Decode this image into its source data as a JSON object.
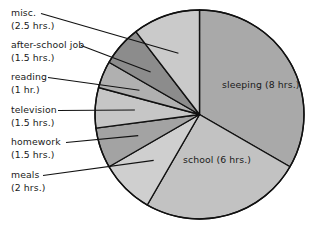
{
  "chart_data": {
    "type": "pie",
    "title": "",
    "subtitle": "",
    "xlabel": "",
    "ylabel": "",
    "total_hours": 24,
    "units": "hrs.",
    "legend_position": "callout-labels-left",
    "grid": false,
    "start_angle_deg": 0,
    "direction": "clockwise",
    "categories": [
      "sleeping",
      "school",
      "meals",
      "homework",
      "television",
      "reading",
      "after-school job",
      "misc."
    ],
    "values": [
      8,
      6,
      2,
      1.5,
      1.5,
      1,
      1.5,
      2.5
    ],
    "slices": [
      {
        "name": "sleeping",
        "label": "sleeping",
        "value_text": "(8 hrs.)",
        "hours": 8,
        "color": "#a9a9a9",
        "start_deg": 0,
        "end_deg": 120,
        "label_placement": "inside"
      },
      {
        "name": "school",
        "label": "school",
        "value_text": "(6 hrs.)",
        "hours": 6,
        "color": "#c2c2c2",
        "start_deg": 120,
        "end_deg": 210,
        "label_placement": "inside"
      },
      {
        "name": "meals",
        "label": "meals",
        "value_text": "(2 hrs.)",
        "hours": 2,
        "color": "#cfcfcf",
        "start_deg": 210,
        "end_deg": 240,
        "label_placement": "callout"
      },
      {
        "name": "homework",
        "label": "homework",
        "value_text": "(1.5 hrs.)",
        "hours": 1.5,
        "color": "#a3a3a3",
        "start_deg": 240,
        "end_deg": 262.5,
        "label_placement": "callout"
      },
      {
        "name": "television",
        "label": "television",
        "value_text": "(1.5 hrs.)",
        "hours": 1.5,
        "color": "#c6c6c6",
        "start_deg": 262.5,
        "end_deg": 285,
        "label_placement": "callout"
      },
      {
        "name": "reading",
        "label": "reading",
        "value_text": "(1 hr.)",
        "hours": 1,
        "color": "#b0b0b0",
        "start_deg": 285,
        "end_deg": 300,
        "label_placement": "callout"
      },
      {
        "name": "after-school-job",
        "label": "after-school job",
        "value_text": "(1.5 hrs.)",
        "hours": 1.5,
        "color": "#8c8c8c",
        "start_deg": 300,
        "end_deg": 322.5,
        "label_placement": "callout"
      },
      {
        "name": "misc",
        "label": "misc.",
        "value_text": "(2.5 hrs.)",
        "hours": 2.5,
        "color": "#cacaca",
        "start_deg": 322.5,
        "end_deg": 360,
        "label_placement": "callout"
      }
    ],
    "geometry": {
      "center_x": 199.5,
      "center_y": 114.5,
      "radius": 104.5,
      "outline_color": "#111111"
    }
  },
  "callouts": {
    "misc": {
      "label": "misc.",
      "value_text": "(2.5 hrs.)"
    },
    "after_school_job": {
      "label": "after-school job",
      "value_text": "(1.5 hrs.)"
    },
    "reading": {
      "label": "reading",
      "value_text": "(1 hr.)"
    },
    "television": {
      "label": "television",
      "value_text": "(1.5 hrs.)"
    },
    "homework": {
      "label": "homework",
      "value_text": "(1.5 hrs.)"
    },
    "meals": {
      "label": "meals",
      "value_text": "(2 hrs.)"
    }
  },
  "inside_labels": {
    "sleeping": {
      "label": "sleeping",
      "value_text": "(8 hrs.)"
    },
    "school": {
      "label": "school",
      "value_text": "(6 hrs.)"
    }
  }
}
